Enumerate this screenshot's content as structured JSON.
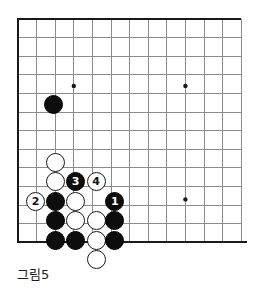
{
  "figure": {
    "caption": "그림5",
    "kind": "go-board-diagram"
  },
  "board": {
    "columns": 13,
    "rows": 13,
    "origin_x": 18,
    "origin_y": 19,
    "spacing": 18.6,
    "line_color": "#8c8c8c",
    "edge_color": "#1a1a1a",
    "background_color": "#ffffff",
    "stone_radius": 9.6,
    "edges": {
      "top": true,
      "left": true,
      "bottom": true,
      "right": false
    },
    "star_points": [
      {
        "col": 3,
        "row": 3.6,
        "name": "star-point-upper-left"
      },
      {
        "col": 9,
        "row": 3.6,
        "name": "star-point-upper-right"
      },
      {
        "col": 9,
        "row": 9.7,
        "name": "star-point-lower-right"
      }
    ],
    "star_point_radius": 2.2
  },
  "stones": [
    {
      "id": "b-corner-approach",
      "color": "black",
      "col": 1.9,
      "row": 4.6,
      "label": ""
    },
    {
      "id": "w-upper",
      "col": 2.0,
      "row": 7.7,
      "color": "white",
      "label": ""
    },
    {
      "id": "w-upper2",
      "col": 2.0,
      "row": 8.75,
      "color": "white",
      "label": ""
    },
    {
      "id": "b-move3",
      "col": 3.1,
      "row": 8.75,
      "color": "black",
      "label": "3"
    },
    {
      "id": "w-move4",
      "col": 4.2,
      "row": 8.75,
      "color": "white",
      "label": "4"
    },
    {
      "id": "w-move2",
      "col": 0.95,
      "row": 9.8,
      "color": "white",
      "label": "2"
    },
    {
      "id": "b-left-a",
      "col": 2.0,
      "row": 9.8,
      "color": "black",
      "label": ""
    },
    {
      "id": "w-center-a",
      "col": 3.1,
      "row": 9.8,
      "color": "white",
      "label": ""
    },
    {
      "id": "b-move1",
      "col": 5.2,
      "row": 9.8,
      "color": "black",
      "label": "1"
    },
    {
      "id": "b-left-b",
      "col": 2.0,
      "row": 10.85,
      "color": "black",
      "label": ""
    },
    {
      "id": "w-center-b",
      "col": 3.1,
      "row": 10.85,
      "color": "white",
      "label": ""
    },
    {
      "id": "w-center-c",
      "col": 4.2,
      "row": 10.85,
      "color": "white",
      "label": ""
    },
    {
      "id": "b-right-b",
      "col": 5.2,
      "row": 10.85,
      "color": "black",
      "label": ""
    },
    {
      "id": "b-bottom-a",
      "col": 2.0,
      "row": 11.9,
      "color": "black",
      "label": ""
    },
    {
      "id": "b-bottom-b",
      "col": 3.1,
      "row": 11.9,
      "color": "black",
      "label": ""
    },
    {
      "id": "w-bottom-c",
      "col": 4.2,
      "row": 11.9,
      "color": "white",
      "label": ""
    },
    {
      "id": "b-bottom-d",
      "col": 5.2,
      "row": 11.9,
      "color": "black",
      "label": ""
    },
    {
      "id": "w-below-edge",
      "col": 4.2,
      "row": 12.95,
      "color": "white",
      "label": ""
    }
  ],
  "move_numbers": [
    {
      "number": "1",
      "color": "black"
    },
    {
      "number": "2",
      "color": "white"
    },
    {
      "number": "3",
      "color": "black"
    },
    {
      "number": "4",
      "color": "white"
    }
  ]
}
